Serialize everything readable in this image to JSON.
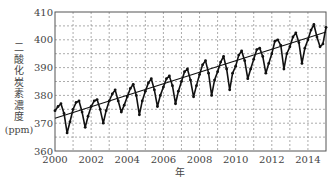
{
  "chart_data": {
    "type": "line",
    "title": "",
    "xlabel": "年",
    "ylabel": "二酸化炭素濃度",
    "ylabel_unit": "(ppm)",
    "xlim": [
      2000,
      2015
    ],
    "ylim": [
      360,
      410
    ],
    "x_ticks": [
      2000,
      2002,
      2004,
      2006,
      2008,
      2010,
      2012,
      2014
    ],
    "y_ticks": [
      360,
      370,
      380,
      390,
      400,
      410
    ],
    "grid": {
      "on": true,
      "style": "dashed",
      "x_step": 1,
      "y_step": 5
    },
    "legend": null,
    "series": [
      {
        "name": "monthly CO2 concentration",
        "style": "line-with-markers",
        "color": "#111111",
        "x": [
          2000.0,
          2000.17,
          2000.33,
          2000.5,
          2000.67,
          2000.83,
          2001.0,
          2001.17,
          2001.33,
          2001.5,
          2001.67,
          2001.83,
          2002.0,
          2002.17,
          2002.33,
          2002.5,
          2002.67,
          2002.83,
          2003.0,
          2003.17,
          2003.33,
          2003.5,
          2003.67,
          2003.83,
          2004.0,
          2004.17,
          2004.33,
          2004.5,
          2004.67,
          2004.83,
          2005.0,
          2005.17,
          2005.33,
          2005.5,
          2005.67,
          2005.83,
          2006.0,
          2006.17,
          2006.33,
          2006.5,
          2006.67,
          2006.83,
          2007.0,
          2007.17,
          2007.33,
          2007.5,
          2007.67,
          2007.83,
          2008.0,
          2008.17,
          2008.33,
          2008.5,
          2008.67,
          2008.83,
          2009.0,
          2009.17,
          2009.33,
          2009.5,
          2009.67,
          2009.83,
          2010.0,
          2010.17,
          2010.33,
          2010.5,
          2010.67,
          2010.83,
          2011.0,
          2011.17,
          2011.33,
          2011.5,
          2011.67,
          2011.83,
          2012.0,
          2012.17,
          2012.33,
          2012.5,
          2012.67,
          2012.83,
          2013.0,
          2013.17,
          2013.33,
          2013.5,
          2013.67,
          2013.83,
          2014.0,
          2014.17,
          2014.33,
          2014.5,
          2014.67,
          2014.83,
          2015.0
        ],
        "y": [
          374.5,
          376.0,
          377.0,
          373.5,
          366.5,
          370.5,
          375.0,
          377.5,
          378.0,
          374.0,
          368.5,
          372.5,
          376.0,
          378.0,
          378.5,
          375.0,
          370.0,
          374.5,
          378.0,
          380.5,
          382.0,
          378.0,
          374.0,
          376.5,
          379.5,
          382.5,
          384.0,
          380.0,
          373.0,
          378.0,
          381.5,
          384.5,
          386.0,
          382.0,
          376.0,
          380.0,
          383.0,
          386.0,
          387.0,
          383.5,
          377.0,
          381.5,
          385.0,
          388.5,
          389.5,
          385.5,
          379.5,
          383.5,
          387.5,
          391.0,
          392.5,
          388.0,
          380.0,
          385.5,
          388.5,
          392.0,
          394.0,
          389.5,
          382.0,
          388.0,
          390.5,
          394.5,
          396.0,
          392.5,
          386.0,
          389.5,
          393.0,
          396.5,
          397.0,
          394.0,
          388.0,
          391.5,
          395.0,
          399.5,
          400.0,
          398.0,
          389.5,
          395.0,
          397.5,
          401.0,
          402.5,
          399.0,
          391.5,
          397.0,
          400.0,
          403.5,
          405.5,
          401.0,
          397.5,
          398.5,
          404.5
        ]
      },
      {
        "name": "linear trend",
        "style": "line",
        "color": "#111111",
        "x": [
          2000,
          2015
        ],
        "y": [
          371.8,
          402.8
        ]
      }
    ]
  },
  "axes": {
    "y_title_chars": [
      "二",
      "酸",
      "化",
      "炭",
      "素",
      "濃",
      "度"
    ],
    "y_unit": "(ppm)",
    "x_title": "年"
  }
}
